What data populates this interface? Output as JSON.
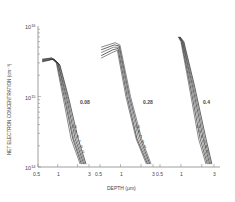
{
  "chart_data": {
    "type": "line",
    "title": "",
    "xlabel": "DEPTH (μm)",
    "ylabel": "NET ELECTRON CONCENTRATION (cm⁻³)",
    "yscale": "log",
    "ylim": [
      100000000000000.0,
      1e+16
    ],
    "y_ticks": [
      "10^16",
      "10^15",
      "10^14"
    ],
    "y_tick_labels": {
      "top": "10",
      "top_exp": "16",
      "mid": "10",
      "mid_exp": "15",
      "bottom": "10",
      "bottom_exp": "14"
    },
    "xscale": "log",
    "grid": false,
    "panels": [
      {
        "label": "0.08",
        "x_ticks": [
          "0.5",
          "1",
          "3"
        ],
        "xlim": [
          0.5,
          3
        ],
        "curve_labels": [
          "10",
          "9",
          "8",
          "7",
          "6",
          "5"
        ],
        "plateau": 3500000000000000.0,
        "series": [
          {
            "name": "5",
            "x": [
              0.58,
              0.8,
              0.95,
              1.2,
              1.6,
              2.2
            ],
            "y": [
              3400000000000000.0,
              3500000000000000.0,
              3000000000000000.0,
              1000000000000000.0,
              250000000000000.0,
              110000000000000.0
            ]
          },
          {
            "name": "6",
            "x": [
              0.58,
              0.8,
              0.97,
              1.25,
              1.7,
              2.3
            ],
            "y": [
              3300000000000000.0,
              3500000000000000.0,
              3000000000000000.0,
              1000000000000000.0,
              250000000000000.0,
              110000000000000.0
            ]
          },
          {
            "name": "7",
            "x": [
              0.58,
              0.82,
              1.0,
              1.3,
              1.75,
              2.4
            ],
            "y": [
              3300000000000000.0,
              3500000000000000.0,
              3000000000000000.0,
              1000000000000000.0,
              250000000000000.0,
              110000000000000.0
            ]
          },
          {
            "name": "8",
            "x": [
              0.58,
              0.84,
              1.02,
              1.35,
              1.85,
              2.5
            ],
            "y": [
              3200000000000000.0,
              3400000000000000.0,
              2900000000000000.0,
              1000000000000000.0,
              250000000000000.0,
              110000000000000.0
            ]
          },
          {
            "name": "9",
            "x": [
              0.58,
              0.86,
              1.05,
              1.4,
              1.95,
              2.6
            ],
            "y": [
              3200000000000000.0,
              3400000000000000.0,
              2900000000000000.0,
              1000000000000000.0,
              250000000000000.0,
              110000000000000.0
            ]
          },
          {
            "name": "10",
            "x": [
              0.58,
              0.88,
              1.08,
              1.45,
              2.05,
              2.7
            ],
            "y": [
              3100000000000000.0,
              3400000000000000.0,
              2800000000000000.0,
              1000000000000000.0,
              250000000000000.0,
              110000000000000.0
            ]
          }
        ]
      },
      {
        "label": "0.28",
        "x_ticks": [
          "0.5",
          "1",
          "3"
        ],
        "xlim": [
          0.5,
          3
        ],
        "curve_labels": [
          "10",
          "9",
          "7",
          "6",
          "5"
        ],
        "plateau": 5000000000000000.0,
        "series": [
          {
            "name": "5",
            "x": [
              0.52,
              0.75,
              0.9,
              1.2,
              1.7,
              2.4
            ],
            "y": [
              3500000000000000.0,
              4200000000000000.0,
              4500000000000000.0,
              1000000000000000.0,
              250000000000000.0,
              110000000000000.0
            ]
          },
          {
            "name": "6",
            "x": [
              0.52,
              0.77,
              0.92,
              1.25,
              1.75,
              2.5
            ],
            "y": [
              3800000000000000.0,
              4600000000000000.0,
              4800000000000000.0,
              1000000000000000.0,
              250000000000000.0,
              110000000000000.0
            ]
          },
          {
            "name": "7",
            "x": [
              0.52,
              0.79,
              0.94,
              1.3,
              1.85,
              2.6
            ],
            "y": [
              4200000000000000.0,
              5000000000000000.0,
              5000000000000000.0,
              1000000000000000.0,
              250000000000000.0,
              110000000000000.0
            ]
          },
          {
            "name": "9",
            "x": [
              0.52,
              0.81,
              0.96,
              1.35,
              1.95,
              2.7
            ],
            "y": [
              4600000000000000.0,
              5400000000000000.0,
              5200000000000000.0,
              1000000000000000.0,
              250000000000000.0,
              110000000000000.0
            ]
          },
          {
            "name": "10",
            "x": [
              0.52,
              0.83,
              0.98,
              1.4,
              2.05,
              2.8
            ],
            "y": [
              5000000000000000.0,
              5800000000000000.0,
              5400000000000000.0,
              1000000000000000.0,
              250000000000000.0,
              110000000000000.0
            ]
          }
        ]
      },
      {
        "label": "0.4",
        "x_ticks": [
          "0.5",
          "1",
          "3"
        ],
        "xlim": [
          0.5,
          3
        ],
        "curve_labels": [
          "10",
          "9",
          "8",
          "7",
          "6",
          "5"
        ],
        "plateau": 6000000000000000.0,
        "series": [
          {
            "name": "5",
            "x": [
              0.92,
              1.0,
              1.3,
              1.8,
              2.3
            ],
            "y": [
              7000000000000000.0,
              6000000000000000.0,
              1500000000000000.0,
              250000000000000.0,
              110000000000000.0
            ]
          },
          {
            "name": "6",
            "x": [
              0.93,
              1.02,
              1.35,
              1.9,
              2.4
            ],
            "y": [
              7000000000000000.0,
              6000000000000000.0,
              1500000000000000.0,
              250000000000000.0,
              110000000000000.0
            ]
          },
          {
            "name": "7",
            "x": [
              0.94,
              1.04,
              1.4,
              2.0,
              2.5
            ],
            "y": [
              7000000000000000.0,
              6000000000000000.0,
              1500000000000000.0,
              250000000000000.0,
              110000000000000.0
            ]
          },
          {
            "name": "8",
            "x": [
              0.95,
              1.06,
              1.45,
              2.1,
              2.6
            ],
            "y": [
              7000000000000000.0,
              6000000000000000.0,
              1500000000000000.0,
              250000000000000.0,
              110000000000000.0
            ]
          },
          {
            "name": "9",
            "x": [
              0.96,
              1.08,
              1.5,
              2.2,
              2.7
            ],
            "y": [
              7000000000000000.0,
              6000000000000000.0,
              1500000000000000.0,
              250000000000000.0,
              110000000000000.0
            ]
          },
          {
            "name": "10",
            "x": [
              0.97,
              1.1,
              1.55,
              2.3,
              2.8
            ],
            "y": [
              7000000000000000.0,
              6000000000000000.0,
              1500000000000000.0,
              250000000000000.0,
              110000000000000.0
            ]
          }
        ]
      }
    ]
  },
  "axes": {
    "xlabel": "DEPTH (μm)",
    "ylabel": "NET ELECTRON CONCENTRATION (cm⁻³)",
    "y_base": "10",
    "y_exp_top": "16",
    "y_exp_mid": "15",
    "y_exp_bottom": "14"
  },
  "panels": [
    {
      "label": "0.08",
      "ticks": [
        "0.5",
        "1",
        "3"
      ]
    },
    {
      "label": "0.28",
      "ticks": [
        "0.5",
        "1",
        "3"
      ]
    },
    {
      "label": "0.4",
      "ticks": [
        "0.5",
        "1",
        "3"
      ]
    }
  ]
}
